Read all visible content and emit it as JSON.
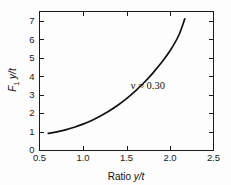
{
  "chart_data": {
    "type": "line",
    "title": "",
    "xlabel": "Ratio y/t",
    "ylabel": "F₁ y/t",
    "ylabel_parts": {
      "main": "F",
      "sub": "1",
      "rest": "y/t"
    },
    "xlim": [
      0.5,
      2.5
    ],
    "ylim": [
      0,
      7.5
    ],
    "xticks": [
      0.5,
      1.0,
      1.5,
      2.0,
      2.5
    ],
    "xticklabels": [
      "0.5",
      "1.0",
      "1.5",
      "2.0",
      "2.5"
    ],
    "yticks": [
      0,
      1,
      2,
      3,
      4,
      5,
      6,
      7
    ],
    "yticklabels": [
      "0",
      "1",
      "2",
      "3",
      "4",
      "5",
      "6",
      "7"
    ],
    "grid": false,
    "legend": "none",
    "tick_direction": "in",
    "frame": "box",
    "series": [
      {
        "name": "F1 y/t vs y/t",
        "x": [
          0.6,
          0.7,
          0.8,
          0.9,
          1.0,
          1.1,
          1.2,
          1.3,
          1.4,
          1.5,
          1.6,
          1.7,
          1.8,
          1.9,
          2.0,
          2.1,
          2.17
        ],
        "values": [
          0.9,
          0.98,
          1.09,
          1.23,
          1.4,
          1.6,
          1.84,
          2.11,
          2.42,
          2.78,
          3.19,
          3.64,
          4.15,
          4.72,
          5.37,
          6.2,
          7.1
        ]
      }
    ],
    "annotations": [
      {
        "text": "ν ≈ 0.30",
        "x": 1.55,
        "y": 3.3
      }
    ],
    "curve_color": "#111111",
    "axis_color": "#1b1b1b",
    "background_color": "#fdfdfd"
  }
}
